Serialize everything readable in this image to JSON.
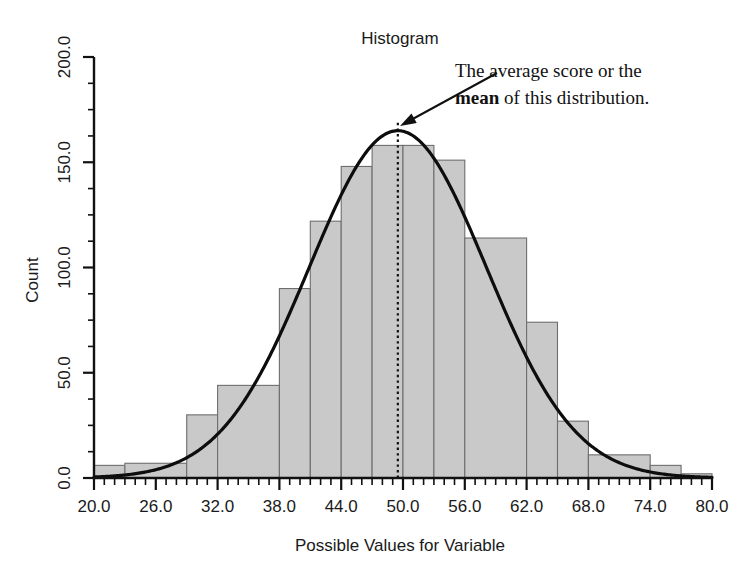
{
  "chart_data": {
    "type": "bar",
    "title": "Histogram",
    "xlabel": "Possible Values for Variable",
    "ylabel": "Count",
    "xlim": [
      20,
      80
    ],
    "ylim": [
      0,
      200
    ],
    "grid": false,
    "legend": null,
    "bin_width": 3,
    "x_major_ticks": [
      20.0,
      26.0,
      32.0,
      38.0,
      44.0,
      50.0,
      56.0,
      62.0,
      68.0,
      74.0,
      80.0
    ],
    "x_major_tick_labels": [
      "20.0",
      "26.0",
      "32.0",
      "38.0",
      "44.0",
      "50.0",
      "56.0",
      "62.0",
      "68.0",
      "74.0",
      "80.0"
    ],
    "x_minor_tick_step": 1,
    "y_major_ticks": [
      0,
      50,
      100,
      150,
      200
    ],
    "y_major_tick_labels": [
      "0.0",
      "50.0",
      "100.0",
      "150.0",
      "200.0"
    ],
    "y_minor_tick_step": 12.5,
    "categories": [
      "20-23",
      "23-26",
      "26-29",
      "29-32",
      "32-35",
      "35-38",
      "38-41",
      "41-44",
      "44-47",
      "47-50",
      "50-53",
      "53-56",
      "56-59",
      "59-62",
      "62-65",
      "65-68",
      "68-71",
      "71-74",
      "74-77",
      "77-80"
    ],
    "bin_starts": [
      20,
      23,
      26,
      29,
      32,
      35,
      38,
      41,
      44,
      47,
      50,
      53,
      56,
      59,
      62,
      65,
      68,
      71,
      74,
      77
    ],
    "values": [
      6,
      7,
      7,
      30,
      44,
      44,
      90,
      122,
      148,
      158,
      158,
      151,
      114,
      114,
      74,
      27,
      11,
      11,
      6,
      2
    ],
    "bars": [
      {
        "start": 20,
        "end": 23,
        "value": 6
      },
      {
        "start": 23,
        "end": 29,
        "value": 7
      },
      {
        "start": 29,
        "end": 32,
        "value": 30
      },
      {
        "start": 32,
        "end": 38,
        "value": 44
      },
      {
        "start": 38,
        "end": 41,
        "value": 90
      },
      {
        "start": 41,
        "end": 44,
        "value": 122
      },
      {
        "start": 44,
        "end": 47,
        "value": 148
      },
      {
        "start": 47,
        "end": 50,
        "value": 158
      },
      {
        "start": 50,
        "end": 53,
        "value": 158
      },
      {
        "start": 53,
        "end": 56,
        "value": 151
      },
      {
        "start": 56,
        "end": 62,
        "value": 114
      },
      {
        "start": 62,
        "end": 65,
        "value": 74
      },
      {
        "start": 65,
        "end": 68,
        "value": 27
      },
      {
        "start": 68,
        "end": 74,
        "value": 11
      },
      {
        "start": 74,
        "end": 77,
        "value": 6
      },
      {
        "start": 77,
        "end": 80,
        "value": 2
      }
    ],
    "overlay_curve": {
      "name": "normal-distribution-curve",
      "kind": "normal",
      "peak_value": 165,
      "mean": 49.5,
      "std_dev": 8.6
    },
    "mean_marker": {
      "name": "mean-dotted-line",
      "x": 49.5,
      "label": "mean"
    },
    "annotation": {
      "line1": "The average score or the",
      "line2_bold": "mean",
      "line2_rest": " of this distribution.",
      "arrow_from_x": 497,
      "arrow_from_y": 73,
      "arrow_to_x": 400,
      "arrow_to_y": 126
    },
    "colors": {
      "bar_fill": "#c9c9c9",
      "bar_stroke": "#6e6e6e",
      "curve": "#0d0d0d",
      "axis": "#111111",
      "text": "#1a1a1a",
      "background": "#ffffff"
    }
  }
}
